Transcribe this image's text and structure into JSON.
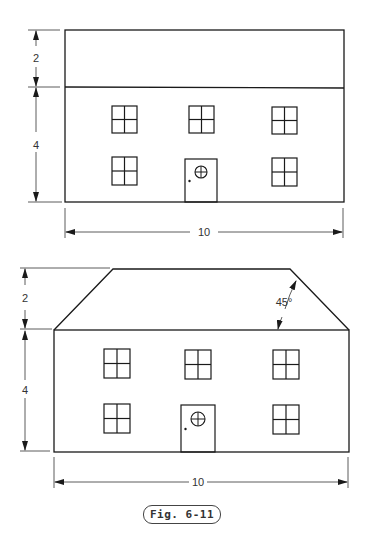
{
  "figure": {
    "caption": "Fig. 6-11"
  },
  "top_view": {
    "dim_roof_height": "2",
    "dim_wall_height": "4",
    "dim_width": "10"
  },
  "bottom_view": {
    "dim_roof_height": "2",
    "dim_wall_height": "4",
    "dim_width": "10",
    "roof_angle": "45°"
  }
}
